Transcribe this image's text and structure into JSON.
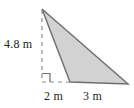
{
  "figure": {
    "kind": "geometry-diagram",
    "shape": "triangle",
    "background_color": "#ffffff",
    "fill_color": "#d2d2d2",
    "stroke_color": "#6e6e6e",
    "dashed_color": "#8c8c8c",
    "text_color": "#231f20",
    "labels": {
      "height": "4.8 m",
      "offset": "2 m",
      "base": "3 m"
    },
    "markers": {
      "right_angle": "right-angle-square"
    },
    "vertices": {
      "apex": [
        42,
        9
      ],
      "base_left": [
        70,
        82
      ],
      "base_right": [
        128,
        84
      ],
      "foot": [
        42,
        82
      ]
    }
  }
}
